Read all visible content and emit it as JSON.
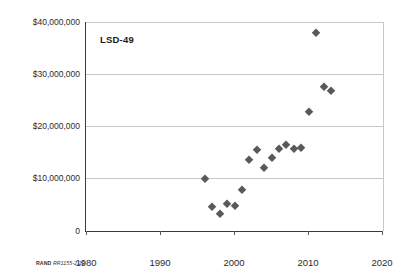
{
  "chart_data": {
    "type": "scatter",
    "title": "LSD-49",
    "xlabel": "",
    "ylabel": "",
    "xlim": [
      1980,
      2020
    ],
    "ylim": [
      0,
      40000000
    ],
    "xticks": [
      "1980",
      "1990",
      "2000",
      "2010",
      "2020"
    ],
    "xtick_values": [
      1980,
      1990,
      2000,
      2010,
      2020
    ],
    "yticks": [
      "0",
      "$10,000,000",
      "$20,000,000",
      "$30,000,000",
      "$40,000,000"
    ],
    "ytick_values": [
      0,
      10000000,
      20000000,
      30000000,
      40000000
    ],
    "grid": "horizontal",
    "legend": "none",
    "marker": "diamond",
    "marker_color": "#595959",
    "series": [
      {
        "name": "LSD-49",
        "points": [
          {
            "x": 1996,
            "y": 10000000
          },
          {
            "x": 1997,
            "y": 4600000
          },
          {
            "x": 1998,
            "y": 3200000
          },
          {
            "x": 1999,
            "y": 5100000
          },
          {
            "x": 2000,
            "y": 4800000
          },
          {
            "x": 2001,
            "y": 7900000
          },
          {
            "x": 2002,
            "y": 13600000
          },
          {
            "x": 2003,
            "y": 15500000
          },
          {
            "x": 2004,
            "y": 12100000
          },
          {
            "x": 2005,
            "y": 13900000
          },
          {
            "x": 2006,
            "y": 15600000
          },
          {
            "x": 2007,
            "y": 16400000
          },
          {
            "x": 2008,
            "y": 15600000
          },
          {
            "x": 2009,
            "y": 15800000
          },
          {
            "x": 2010,
            "y": 22700000
          },
          {
            "x": 2011,
            "y": 37900000
          },
          {
            "x": 2012,
            "y": 27500000
          },
          {
            "x": 2013,
            "y": 26700000
          }
        ]
      }
    ]
  },
  "credit": {
    "org": "RAND",
    "id": "RR1155-2.10"
  }
}
